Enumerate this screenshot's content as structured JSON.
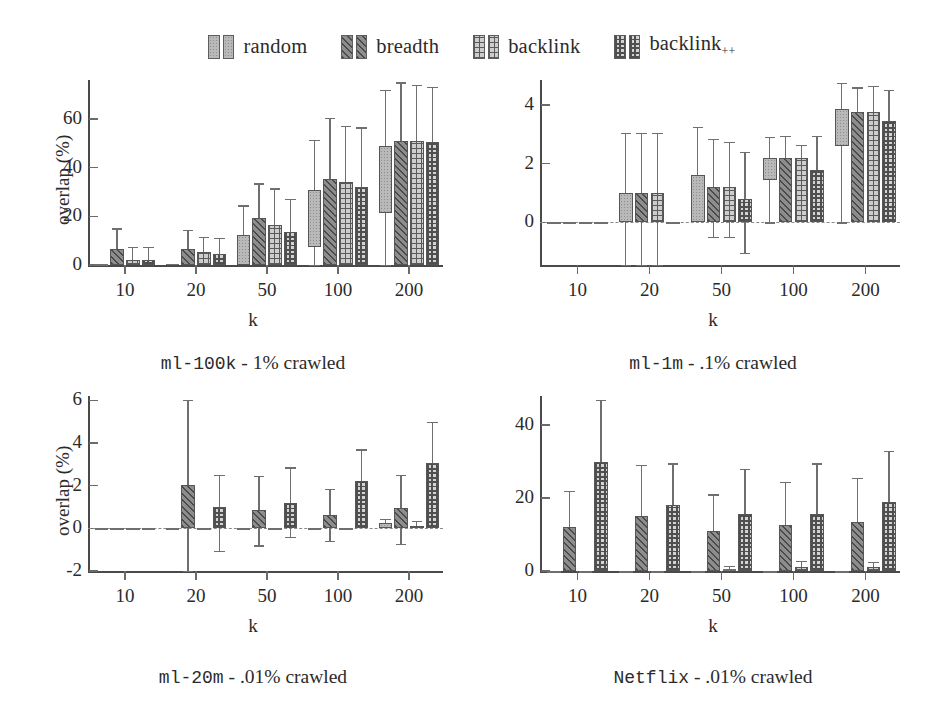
{
  "legend": {
    "items": [
      {
        "label": "random",
        "pattern": "p-random",
        "icon": "legend-swatch-icon"
      },
      {
        "label": "breadth",
        "pattern": "p-breadth",
        "icon": "legend-swatch-icon"
      },
      {
        "label": "backlink",
        "pattern": "p-backlink",
        "icon": "legend-swatch-icon"
      },
      {
        "label": "backlink",
        "sub": "++",
        "pattern": "p-backlinkpp",
        "icon": "legend-swatch-icon"
      }
    ]
  },
  "axis_title_x": "k",
  "axis_title_y": "overlap (%)",
  "chart_data": [
    {
      "id": "ml-100k",
      "type": "bar",
      "title": "ml-100k - 1% crawled",
      "title_mono": "ml-100k",
      "title_rest": " - 1% crawled",
      "xlabel": "k",
      "ylabel": "overlap (%)",
      "categories": [
        "10",
        "20",
        "50",
        "100",
        "200"
      ],
      "yticks": [
        0,
        20,
        40,
        60
      ],
      "ylim": [
        0,
        76
      ],
      "grid": false,
      "legend_position": "top-center",
      "series": [
        {
          "name": "random",
          "values": [
            0.3,
            0.6,
            12.5,
            31,
            49
          ],
          "bar_base": [
            0,
            0,
            0,
            7.5,
            21.5
          ],
          "err_low": [
            0,
            0,
            0,
            0,
            0
          ],
          "err_high": [
            0.3,
            0.6,
            24.5,
            51.5,
            72
          ]
        },
        {
          "name": "breadth",
          "values": [
            6.5,
            6.5,
            19.5,
            35.5,
            51
          ],
          "bar_base": [
            0,
            0,
            0,
            0,
            0
          ],
          "err_low": [
            0,
            0,
            0,
            0,
            0
          ],
          "err_high": [
            15,
            14.5,
            33.5,
            60.5,
            75
          ]
        },
        {
          "name": "backlink",
          "values": [
            2,
            5.5,
            16.5,
            34,
            51
          ],
          "bar_base": [
            0,
            0,
            0,
            0,
            0
          ],
          "err_low": [
            0,
            0,
            0,
            0,
            0
          ],
          "err_high": [
            7.5,
            11.5,
            31.5,
            57,
            74
          ]
        },
        {
          "name": "backlink++",
          "values": [
            2,
            4.5,
            13.5,
            32,
            50.5
          ],
          "bar_base": [
            0,
            0,
            0,
            0,
            0
          ],
          "err_low": [
            0,
            0,
            0,
            0,
            0
          ],
          "err_high": [
            7.5,
            11,
            27,
            56.5,
            73
          ]
        }
      ]
    },
    {
      "id": "ml-1m",
      "type": "bar",
      "title": "ml-1m - .1% crawled",
      "title_mono": "ml-1m",
      "title_rest": " - .1% crawled",
      "xlabel": "k",
      "ylabel": "",
      "categories": [
        "10",
        "20",
        "50",
        "100",
        "200"
      ],
      "yticks": [
        0,
        2,
        4
      ],
      "ylim": [
        -1.45,
        4.85
      ],
      "grid": false,
      "zero_line": true,
      "legend_position": "top-center",
      "series": [
        {
          "name": "random",
          "values": [
            0,
            1.0,
            1.6,
            2.2,
            3.85
          ],
          "bar_base": [
            0,
            0,
            0,
            1.45,
            2.6
          ],
          "err_low": [
            0,
            -1.45,
            0,
            0,
            0
          ],
          "err_high": [
            0,
            3.05,
            3.25,
            2.9,
            4.75
          ]
        },
        {
          "name": "breadth",
          "values": [
            0,
            1.0,
            1.2,
            2.2,
            3.75
          ],
          "bar_base": [
            0,
            0,
            0,
            0,
            0
          ],
          "err_low": [
            0,
            -1.45,
            -0.5,
            0,
            0
          ],
          "err_high": [
            0,
            3.05,
            2.85,
            2.95,
            4.6
          ]
        },
        {
          "name": "backlink",
          "values": [
            0,
            1.0,
            1.2,
            2.2,
            3.75
          ],
          "bar_base": [
            0,
            0,
            0,
            0,
            0
          ],
          "err_low": [
            0,
            -1.45,
            -0.5,
            0,
            0
          ],
          "err_high": [
            0,
            3.05,
            2.75,
            2.65,
            4.65
          ]
        },
        {
          "name": "backlink++",
          "values": [
            0,
            0,
            0.8,
            1.8,
            3.45
          ],
          "bar_base": [
            0,
            0,
            0,
            0,
            0
          ],
          "err_low": [
            0,
            0,
            -1.05,
            0,
            0
          ],
          "err_high": [
            0,
            0,
            2.4,
            2.95,
            4.5
          ]
        }
      ]
    },
    {
      "id": "ml-20m",
      "type": "bar",
      "title": "ml-20m - .01% crawled",
      "title_mono": "ml-20m",
      "title_rest": " - .01% crawled",
      "xlabel": "k",
      "ylabel": "overlap (%)",
      "categories": [
        "10",
        "20",
        "50",
        "100",
        "200"
      ],
      "yticks": [
        -2,
        0,
        2,
        4,
        6
      ],
      "ylim": [
        -2,
        6.2
      ],
      "grid": false,
      "zero_line": true,
      "legend_position": "top-center",
      "series": [
        {
          "name": "random",
          "values": [
            0,
            0,
            0,
            0,
            0.25
          ],
          "bar_base": [
            0,
            0,
            0,
            0,
            0
          ],
          "err_low": [
            0,
            0,
            0,
            0,
            0
          ],
          "err_high": [
            0,
            0,
            0,
            0,
            0.45
          ]
        },
        {
          "name": "breadth",
          "values": [
            0,
            2.05,
            0.85,
            0.62,
            0.95
          ],
          "bar_base": [
            0,
            0,
            0,
            0,
            0
          ],
          "err_low": [
            0,
            -2,
            -0.8,
            -0.6,
            -0.72
          ],
          "err_high": [
            0,
            6.0,
            2.45,
            1.85,
            2.5
          ]
        },
        {
          "name": "backlink",
          "values": [
            0,
            0,
            0,
            0,
            0.12
          ],
          "bar_base": [
            0,
            0,
            0,
            0,
            0
          ],
          "err_low": [
            0,
            0,
            0,
            0,
            0
          ],
          "err_high": [
            0,
            0,
            0,
            0,
            0.35
          ]
        },
        {
          "name": "backlink++",
          "values": [
            0,
            1.0,
            1.2,
            2.2,
            3.05
          ],
          "bar_base": [
            0,
            0,
            0,
            0,
            0
          ],
          "err_low": [
            0,
            -1.05,
            -0.4,
            0,
            0
          ],
          "err_high": [
            0,
            2.5,
            2.85,
            3.7,
            5.0
          ]
        }
      ]
    },
    {
      "id": "Netflix",
      "type": "bar",
      "title": "Netflix - .01% crawled",
      "title_mono": "Netflix",
      "title_rest": " - .01% crawled",
      "xlabel": "k",
      "ylabel": "",
      "categories": [
        "10",
        "20",
        "50",
        "100",
        "200"
      ],
      "yticks": [
        0,
        20,
        40
      ],
      "ylim": [
        0,
        48
      ],
      "grid": false,
      "legend_position": "top-center",
      "series": [
        {
          "name": "random",
          "values": [
            0,
            0,
            0,
            0,
            0
          ],
          "bar_base": [
            0,
            0,
            0,
            0,
            0
          ],
          "err_low": [
            0,
            0,
            0,
            0,
            0
          ],
          "err_high": [
            0,
            0,
            0,
            0,
            0
          ]
        },
        {
          "name": "breadth",
          "values": [
            12,
            15,
            11,
            12.5,
            13.5
          ],
          "bar_base": [
            0,
            0,
            0,
            0,
            0
          ],
          "err_low": [
            0,
            0,
            0,
            0,
            0
          ],
          "err_high": [
            22,
            29,
            21,
            24.5,
            25.5
          ]
        },
        {
          "name": "backlink",
          "values": [
            0,
            0,
            0.6,
            1.2,
            1.0
          ],
          "bar_base": [
            0,
            0,
            0,
            0,
            0
          ],
          "err_low": [
            0,
            0,
            0,
            0,
            0
          ],
          "err_high": [
            0,
            0,
            1.4,
            2.8,
            2.4
          ]
        },
        {
          "name": "backlink++",
          "values": [
            30,
            18,
            15.5,
            15.5,
            19
          ],
          "bar_base": [
            0,
            0,
            0,
            0,
            0
          ],
          "err_low": [
            0,
            0,
            0,
            0,
            0
          ],
          "err_high": [
            47,
            29.5,
            28,
            29.5,
            33
          ]
        }
      ]
    }
  ]
}
